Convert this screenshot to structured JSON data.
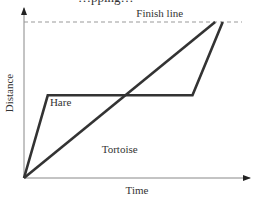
{
  "chart_data": {
    "type": "line",
    "title": "",
    "xlabel": "Time",
    "ylabel": "Distance",
    "xlim": [
      0,
      10
    ],
    "ylim": [
      0,
      10
    ],
    "grid": false,
    "ticks": false,
    "reference_lines": [
      {
        "name": "Finish line",
        "label": "Finish line",
        "y": 10,
        "style": "dashed",
        "color": "#999999"
      }
    ],
    "series": [
      {
        "name": "Hare",
        "label": "Hare",
        "color": "#333333",
        "points": [
          [
            0,
            0
          ],
          [
            1.1,
            5.3
          ],
          [
            7.8,
            5.3
          ],
          [
            9.2,
            10
          ]
        ]
      },
      {
        "name": "Tortoise",
        "label": "Tortoise",
        "color": "#333333",
        "points": [
          [
            0,
            0
          ],
          [
            8.85,
            10
          ]
        ]
      }
    ],
    "annotations": [
      {
        "text": "Hare",
        "x": 1.2,
        "y": 4.6
      },
      {
        "text": "Tortoise",
        "x": 3.6,
        "y": 1.6
      },
      {
        "text": "Finish line",
        "x": 5.2,
        "y": 10.35
      }
    ]
  },
  "clipped_top_text": "…pping…"
}
